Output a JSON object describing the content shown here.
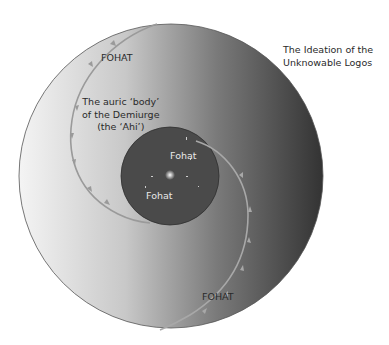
{
  "title": {
    "line1": "The Ideation of the",
    "line2": "Unknowable Logos"
  },
  "labels": {
    "fohat_top": "FOHAT",
    "auric_line1": "The auric ‘body’",
    "auric_line2": "of the Demiurge",
    "auric_line3": "(the ‘Ahi’)",
    "inner_fohat_1": "Fohat",
    "inner_fohat_2": "Fohat",
    "fohat_bottom": "FOHAT"
  },
  "colors": {
    "outer_light": "#f2f2f2",
    "outer_dark": "#3a3a3a",
    "inner_circle": "#4a4a4a",
    "spiral": "#9a9a9a",
    "outline": "#555555"
  }
}
